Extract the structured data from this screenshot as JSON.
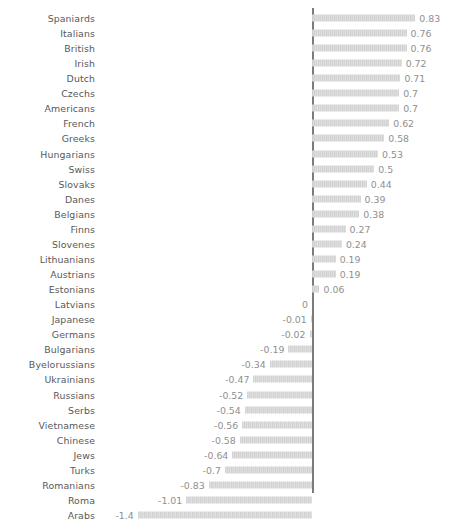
{
  "chart_data": {
    "type": "bar",
    "orientation": "horizontal",
    "title": "",
    "subtitle": "",
    "xlabel": "",
    "ylabel": "",
    "grid": false,
    "legend": null,
    "axis_line": "zero",
    "xlim": [
      -1.5,
      1.0
    ],
    "categories": [
      "Spaniards",
      "Italians",
      "British",
      "Irish",
      "Dutch",
      "Czechs",
      "Americans",
      "French",
      "Greeks",
      "Hungarians",
      "Swiss",
      "Slovaks",
      "Danes",
      "Belgians",
      "Finns",
      "Slovenes",
      "Lithuanians",
      "Austrians",
      "Estonians",
      "Latvians",
      "Japanese",
      "Germans",
      "Bulgarians",
      "Byelorussians",
      "Ukrainians",
      "Russians",
      "Serbs",
      "Vietnamese",
      "Chinese",
      "Jews",
      "Turks",
      "Romanians",
      "Roma",
      "Arabs"
    ],
    "values": [
      0.83,
      0.76,
      0.76,
      0.72,
      0.71,
      0.7,
      0.7,
      0.62,
      0.58,
      0.53,
      0.5,
      0.44,
      0.39,
      0.38,
      0.27,
      0.24,
      0.19,
      0.19,
      0.06,
      0,
      -0.01,
      -0.02,
      -0.19,
      -0.34,
      -0.47,
      -0.52,
      -0.54,
      -0.56,
      -0.58,
      -0.64,
      -0.7,
      -0.83,
      -1.01,
      -1.4
    ],
    "value_labels": [
      "0.83",
      "0.76",
      "0.76",
      "0.72",
      "0.71",
      "0.7",
      "0.7",
      "0.62",
      "0.58",
      "0.53",
      "0.5",
      "0.44",
      "0.39",
      "0.38",
      "0.27",
      "0.24",
      "0.19",
      "0.19",
      "0.06",
      "0",
      "-0.01",
      "-0.02",
      "-0.19",
      "-0.34",
      "-0.47",
      "-0.52",
      "-0.54",
      "-0.56",
      "-0.58",
      "-0.64",
      "-0.7",
      "-0.83",
      "-1.01",
      "-1.4"
    ],
    "colors": {
      "bar": "#d5d5d5",
      "axis": "#7b7b7b",
      "category_text": "#595959",
      "value_text": "#8f8f8f",
      "background": "#ffffff"
    }
  },
  "layout": {
    "zero_x_px": 312,
    "px_per_unit": 124.5,
    "row_height_px": 15.06,
    "top_offset_px": 10.5,
    "label_right_edge_px": 95
  }
}
